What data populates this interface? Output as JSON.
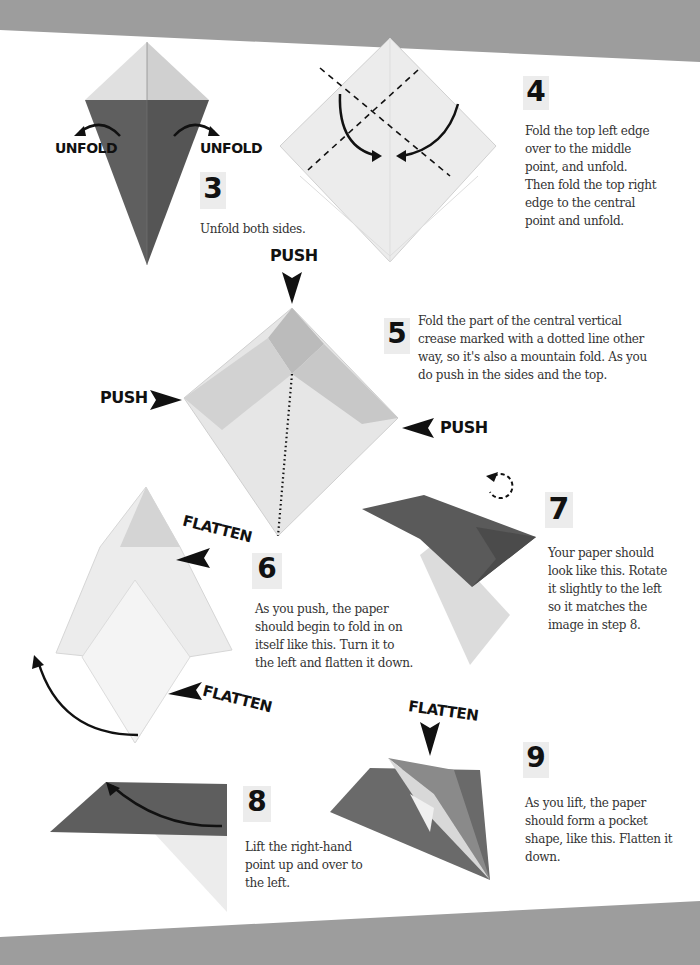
{
  "colors": {
    "band": "#9d9d9d",
    "paper_dark": "#5c5c5c",
    "paper_mid": "#8a8a8a",
    "paper_light": "#d8d8d8",
    "paper_white": "#f1f1f1",
    "number_bg": "#ececec",
    "text": "#333333"
  },
  "steps": [
    {
      "number": "3",
      "text": "Unfold both sides.",
      "labels": [
        "UNFOLD",
        "UNFOLD"
      ]
    },
    {
      "number": "4",
      "text": [
        "Fold the top left edge",
        "over to the middle",
        "point, and unfold.",
        "Then fold the top right",
        "edge to the central",
        "point and unfold."
      ]
    },
    {
      "number": "5",
      "text": [
        "Fold the part of the central vertical",
        "crease marked with a dotted line other",
        "way, so it's also a mountain fold. As you",
        "do push in the sides and the top."
      ],
      "labels": [
        "PUSH",
        "PUSH",
        "PUSH"
      ]
    },
    {
      "number": "6",
      "text": [
        "As you push, the paper",
        "should begin to fold in on",
        "itself like this. Turn it to",
        "the left and flatten it down."
      ],
      "labels": [
        "FLATTEN",
        "FLATTEN"
      ]
    },
    {
      "number": "7",
      "text": [
        "Your paper should",
        "look like this. Rotate",
        "it slightly to the left",
        "so it matches the",
        "image in step 8."
      ]
    },
    {
      "number": "8",
      "text": [
        "Lift the right-hand",
        "point up and over to",
        "the left."
      ]
    },
    {
      "number": "9",
      "text": [
        "As you lift, the paper",
        "should form a pocket",
        "shape, like this. Flatten it",
        "down."
      ],
      "labels": [
        "FLATTEN"
      ]
    }
  ]
}
